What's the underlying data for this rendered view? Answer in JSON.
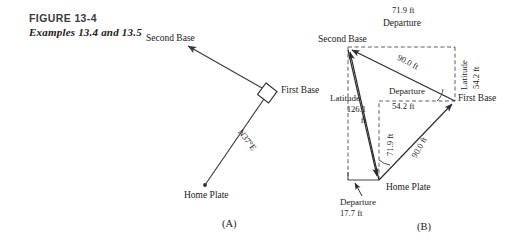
{
  "figure": {
    "title": "FIGURE 13-4",
    "subtitle": "Examples 13.4 and 13.5"
  },
  "panel_a": {
    "tag": "(A)",
    "points": [
      {
        "name": "Second Base",
        "label": "Second Base"
      },
      {
        "name": "First Base",
        "label": "First Base"
      },
      {
        "name": "Home Plate",
        "label": "Home Plate"
      }
    ],
    "bearing_label": "N37°E"
  },
  "panel_b": {
    "tag": "(B)",
    "points": [
      {
        "name": "Second Base",
        "label": "Second Base"
      },
      {
        "name": "First Base",
        "label": "First Base"
      },
      {
        "name": "Home Plate",
        "label": "Home Plate"
      }
    ],
    "annotations": {
      "top_departure_value": "71.9 ft",
      "top_departure_word": "Departure",
      "right_latitude_word": "Latitude",
      "right_latitude_value": "54.2 ft",
      "left_latitude_word": "Latitude",
      "left_latitude_value": "126.1",
      "left_latitude_unit": "ft",
      "mid_departure_word": "Departure",
      "mid_departure_value": "54.2 ft",
      "mid_vertical_value": "71.9 ft",
      "upper_distance": "90.0 ft",
      "lower_distance": "90.0 ft",
      "bottom_departure_word": "Departure",
      "bottom_departure_value": "17.7 ft"
    }
  },
  "colors": {
    "ink": "#1a1a1a",
    "line": "#3a3a3a",
    "dashed": "#555555",
    "background": "#ffffff"
  }
}
